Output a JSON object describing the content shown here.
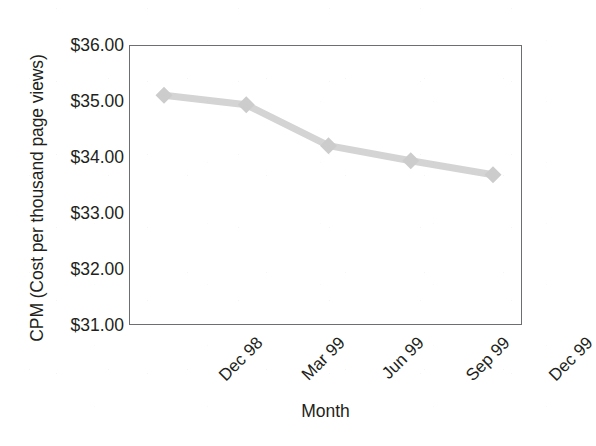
{
  "chart_data": {
    "type": "line",
    "title": "",
    "xlabel": "Month",
    "ylabel": "CPM (Cost per thousand page views)",
    "categories": [
      "Dec 98",
      "Mar 99",
      "Jun 99",
      "Sep 99",
      "Dec 99"
    ],
    "values": [
      35.12,
      34.95,
      34.22,
      33.95,
      33.7
    ],
    "series": [
      {
        "name": "CPM",
        "values": [
          35.12,
          34.95,
          34.22,
          33.95,
          33.7
        ]
      }
    ],
    "ylim": [
      31.0,
      36.0
    ],
    "ytick_values": [
      36.0,
      35.0,
      34.0,
      33.0,
      32.0,
      31.0
    ],
    "ytick_labels": [
      "$36.00",
      "$35.00",
      "$34.00",
      "$33.00",
      "$32.00",
      "$31.00"
    ],
    "xtick_labels": [
      "Dec 98",
      "Mar 99",
      "Jun 99",
      "Sep 99",
      "Dec 99"
    ],
    "grid": false,
    "legend": false,
    "legend_position": "none",
    "marker": "diamond",
    "line_color": "#d4d4d4",
    "marker_color": "#cccccc",
    "axis_color": "#6d6e71",
    "text_color": "#231f20",
    "background_color": "#ffffff"
  }
}
